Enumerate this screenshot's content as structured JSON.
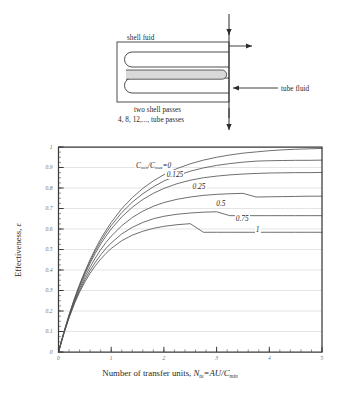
{
  "schematic": {
    "name": "two-shell-pass-heat-exchanger",
    "shell_fluid_label": "shell fuid",
    "tube_fluid_label": "tube fluid",
    "passes_line_1": "two shell passes",
    "passes_line_2": "4, 8, 12,..., tube passes"
  },
  "chart_data": {
    "type": "line",
    "title": "",
    "xlabel": "Number of transfer units, Ntu=AU/Cmin",
    "ylabel": "Effectiveness, ε",
    "xlim": [
      0,
      5
    ],
    "ylim": [
      0,
      1
    ],
    "xticks": [
      0,
      1,
      2,
      3,
      4,
      5
    ],
    "xtick_labels": [
      "0",
      "1",
      "2",
      "3",
      "4",
      "5"
    ],
    "yticks": [
      0,
      0.1,
      0.2,
      0.3,
      0.4,
      0.5,
      0.6,
      0.7,
      0.8,
      0.9,
      1
    ],
    "ytick_labels": [
      "0",
      "0.1",
      "0.2",
      "0.3",
      "0.4",
      "0.5",
      "0.6",
      "0.7",
      "0.8",
      "0.9",
      "1"
    ],
    "grid": "horizontal",
    "legend_position": "inline-curve-labels",
    "xtick_minor_step": 0.2,
    "ytick_minor_step": 0.025,
    "series": [
      {
        "name": "Cmin/Cmax=0",
        "label": "C<sub>min</sub>/C<sub>max</sub>=0",
        "ratio": 0,
        "label_x": 1.45,
        "label_y": 0.905,
        "x": [
          0,
          0.1,
          0.2,
          0.3,
          0.4,
          0.5,
          0.6,
          0.7,
          0.8,
          0.9,
          1.0,
          1.2,
          1.4,
          1.6,
          1.8,
          2.0,
          2.25,
          2.5,
          2.75,
          3.0,
          3.25,
          3.5,
          3.75,
          4.0,
          4.25,
          4.5,
          4.75,
          5.0
        ],
        "y": [
          0,
          0.095,
          0.181,
          0.259,
          0.33,
          0.393,
          0.451,
          0.503,
          0.551,
          0.593,
          0.632,
          0.699,
          0.753,
          0.798,
          0.835,
          0.865,
          0.895,
          0.918,
          0.936,
          0.95,
          0.961,
          0.97,
          0.976,
          0.982,
          0.986,
          0.989,
          0.991,
          0.993
        ]
      },
      {
        "name": "0.125",
        "label": "0.125",
        "ratio": 0.125,
        "label_x": 2.03,
        "label_y": 0.862,
        "x": [
          0,
          0.1,
          0.2,
          0.3,
          0.4,
          0.5,
          0.6,
          0.7,
          0.8,
          0.9,
          1.0,
          1.2,
          1.4,
          1.6,
          1.8,
          2.0,
          2.25,
          2.5,
          2.75,
          3.0,
          3.25,
          3.5,
          3.75,
          4.0,
          4.25,
          4.5,
          4.75,
          5.0
        ],
        "y": [
          0,
          0.094,
          0.179,
          0.256,
          0.325,
          0.387,
          0.443,
          0.494,
          0.539,
          0.58,
          0.617,
          0.68,
          0.731,
          0.772,
          0.806,
          0.834,
          0.861,
          0.882,
          0.898,
          0.91,
          0.919,
          0.926,
          0.931,
          0.933,
          0.934,
          0.935,
          0.935,
          0.936
        ]
      },
      {
        "name": "0.25",
        "label": "0.25",
        "ratio": 0.25,
        "label_x": 2.52,
        "label_y": 0.805,
        "x": [
          0,
          0.1,
          0.2,
          0.3,
          0.4,
          0.5,
          0.6,
          0.7,
          0.8,
          0.9,
          1.0,
          1.2,
          1.4,
          1.6,
          1.8,
          2.0,
          2.25,
          2.5,
          2.75,
          3.0,
          3.25,
          3.5,
          3.75,
          4.0,
          4.25,
          4.5,
          4.75,
          5.0
        ],
        "y": [
          0,
          0.093,
          0.177,
          0.252,
          0.319,
          0.379,
          0.433,
          0.482,
          0.526,
          0.565,
          0.6,
          0.659,
          0.706,
          0.744,
          0.774,
          0.798,
          0.821,
          0.838,
          0.85,
          0.858,
          0.864,
          0.868,
          0.871,
          0.873,
          0.874,
          0.875,
          0.875,
          0.876
        ]
      },
      {
        "name": "0.5",
        "label": "0.5",
        "ratio": 0.5,
        "label_x": 2.97,
        "label_y": 0.718,
        "x": [
          0,
          0.1,
          0.2,
          0.3,
          0.4,
          0.5,
          0.6,
          0.7,
          0.8,
          0.9,
          1.0,
          1.2,
          1.4,
          1.6,
          1.8,
          2.0,
          2.25,
          2.5,
          2.75,
          3.0,
          3.25,
          3.5,
          3.75,
          4.0,
          4.25,
          4.5,
          4.75,
          5.0
        ],
        "y": [
          0,
          0.091,
          0.173,
          0.245,
          0.309,
          0.365,
          0.415,
          0.459,
          0.499,
          0.534,
          0.565,
          0.616,
          0.656,
          0.687,
          0.711,
          0.729,
          0.745,
          0.756,
          0.764,
          0.769,
          0.772,
          0.774,
          0.756,
          0.757,
          0.758,
          0.759,
          0.76,
          0.76
        ]
      },
      {
        "name": "0.75",
        "label": "0.75",
        "ratio": 0.75,
        "label_x": 3.34,
        "label_y": 0.648,
        "x": [
          0,
          0.1,
          0.2,
          0.3,
          0.4,
          0.5,
          0.6,
          0.7,
          0.8,
          0.9,
          1.0,
          1.2,
          1.4,
          1.6,
          1.8,
          2.0,
          2.25,
          2.5,
          2.75,
          3.0,
          3.25,
          3.5,
          3.75,
          4.0,
          4.25,
          4.5,
          4.75,
          5.0
        ],
        "y": [
          0,
          0.089,
          0.169,
          0.239,
          0.299,
          0.352,
          0.398,
          0.438,
          0.474,
          0.505,
          0.532,
          0.576,
          0.608,
          0.632,
          0.65,
          0.662,
          0.672,
          0.678,
          0.682,
          0.684,
          0.665,
          0.665,
          0.665,
          0.665,
          0.665,
          0.665,
          0.665,
          0.665
        ]
      },
      {
        "name": "1",
        "label": "1",
        "ratio": 1,
        "label_x": 3.72,
        "label_y": 0.592,
        "x": [
          0,
          0.1,
          0.2,
          0.3,
          0.4,
          0.5,
          0.6,
          0.7,
          0.8,
          0.9,
          1.0,
          1.2,
          1.4,
          1.6,
          1.8,
          2.0,
          2.25,
          2.5,
          2.75,
          3.0,
          3.25,
          3.5,
          3.75,
          4.0,
          4.25,
          4.5,
          4.75,
          5.0
        ],
        "y": [
          0,
          0.088,
          0.166,
          0.234,
          0.292,
          0.341,
          0.384,
          0.421,
          0.453,
          0.481,
          0.505,
          0.543,
          0.57,
          0.589,
          0.603,
          0.613,
          0.621,
          0.626,
          0.584,
          0.584,
          0.584,
          0.584,
          0.584,
          0.584,
          0.584,
          0.584,
          0.584,
          0.584
        ]
      }
    ]
  },
  "colors": {
    "curve": "#555555",
    "axis": "#3a3a3a",
    "grid": "#d8d8d8",
    "tick_text": "#6e6e6e",
    "schematic_line": "#3a3a3a",
    "tube_fill": "#d9d9d9"
  }
}
